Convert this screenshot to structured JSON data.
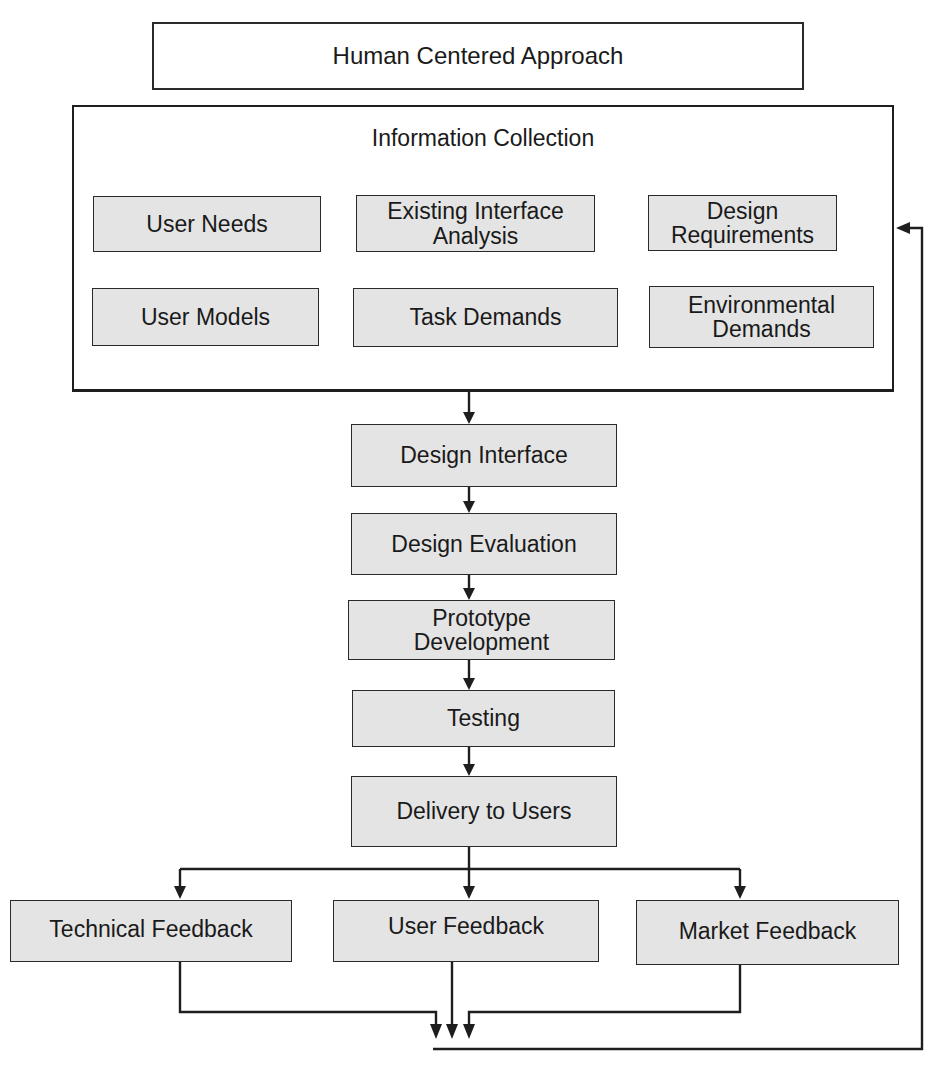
{
  "title": "Human Centered Approach",
  "info_panel": {
    "title": "Information Collection",
    "items": [
      "User Needs",
      "Existing Interface\nAnalysis",
      "Design\nRequirements",
      "User Models",
      "Task Demands",
      "Environmental\nDemands"
    ]
  },
  "process_steps": [
    "Design Interface",
    "Design Evaluation",
    "Prototype\nDevelopment",
    "Testing",
    "Delivery to Users"
  ],
  "feedback": [
    "Technical Feedback",
    "User Feedback",
    "Market Feedback"
  ],
  "colors": {
    "box_fill": "#e4e4e4",
    "line": "#1e1e1e"
  }
}
